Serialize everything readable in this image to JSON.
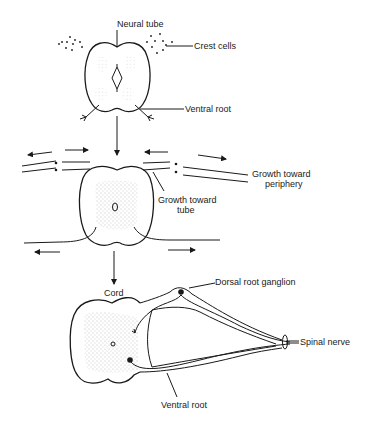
{
  "figure": {
    "stages": [
      {
        "id": "stage-1",
        "structure": "neural tube",
        "labels": {
          "neural_tube": "Neural tube",
          "crest_cells": "Crest cells",
          "ventral_root": "Ventral root"
        }
      },
      {
        "id": "stage-2",
        "structure": "growing roots",
        "labels": {
          "growth_toward_periphery_line1": "Growth toward",
          "growth_toward_periphery_line2": "periphery",
          "growth_toward_tube_line1": "Growth toward",
          "growth_toward_tube_line2": "tube"
        }
      },
      {
        "id": "stage-3",
        "structure": "spinal cord",
        "labels": {
          "cord": "Cord",
          "dorsal_root_ganglion": "Dorsal root ganglion",
          "spinal_nerve": "Spinal nerve",
          "ventral_root": "Ventral root"
        }
      }
    ],
    "colors": {
      "line": "#1a1a1a",
      "stipple": "#777777",
      "background": "#ffffff"
    }
  }
}
